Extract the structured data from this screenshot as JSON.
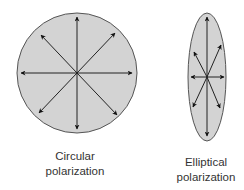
{
  "diagram": {
    "circular": {
      "label_line1": "Circular",
      "label_line2": "polarization",
      "shape": "circle",
      "fill": "#d3d3d3",
      "stroke": "#555555",
      "arrow_count": 8
    },
    "elliptical": {
      "label_line1": "Elliptical",
      "label_line2": "polarization",
      "shape": "ellipse",
      "fill": "#d3d3d3",
      "stroke": "#555555",
      "arrow_count": 8
    },
    "arrow_color": "#111111"
  }
}
